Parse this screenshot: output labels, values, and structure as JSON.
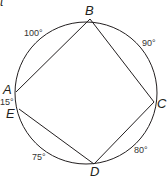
{
  "figure": {
    "corner_fragment": "t",
    "circle": {
      "cx": 86,
      "cy": 93,
      "r": 71
    },
    "points": [
      {
        "name": "A",
        "x": 16,
        "y": 92,
        "label_x": 3,
        "label_y": 94
      },
      {
        "name": "B",
        "x": 90,
        "y": 19,
        "label_x": 85,
        "label_y": 15
      },
      {
        "name": "C",
        "x": 154,
        "y": 102,
        "label_x": 158,
        "label_y": 108
      },
      {
        "name": "D",
        "x": 94,
        "y": 164,
        "label_x": 90,
        "label_y": 176
      },
      {
        "name": "E",
        "x": 19,
        "y": 109,
        "label_x": 6,
        "label_y": 118
      }
    ],
    "segments": [
      [
        "A",
        "B"
      ],
      [
        "B",
        "C"
      ],
      [
        "C",
        "D"
      ],
      [
        "D",
        "E"
      ]
    ],
    "arc_labels": [
      {
        "text": "100°",
        "between": "A-B",
        "x": 24,
        "y": 36
      },
      {
        "text": "90°",
        "between": "B-C",
        "x": 142,
        "y": 46
      },
      {
        "text": "80°",
        "between": "C-D",
        "x": 134,
        "y": 153
      },
      {
        "text": "75°",
        "between": "D-E",
        "x": 32,
        "y": 160
      },
      {
        "text": "15°",
        "between": "E-A",
        "x": 0,
        "y": 105
      }
    ]
  }
}
